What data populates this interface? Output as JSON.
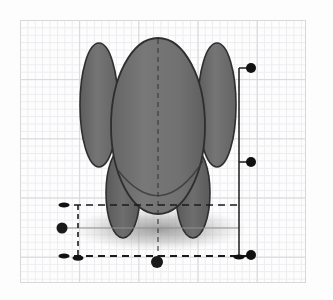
{
  "app": {
    "kind": "3d-modeling-viewport",
    "view_label": "front",
    "background_color": "#fdfdfd"
  },
  "canvas": {
    "x": 20,
    "y": 20,
    "width": 286,
    "height": 263,
    "border_color": "#d8d8d8",
    "grid": {
      "minor_color": "#ececf0",
      "minor_spacing": 7.4,
      "major_color": "#d6d6dc",
      "major_spacing": 59.2,
      "visible": true
    }
  },
  "model": {
    "name": "organic-blob-figure",
    "fill_color": "#6f6f6f",
    "fill_color_dark": "#5c5c5c",
    "outline_color": "#2e2e2e",
    "shadow_color": "#9a9a9a",
    "parts": [
      {
        "name": "left-arm-lobe",
        "cx": 98,
        "cy": 104,
        "rx": 19,
        "ry": 62
      },
      {
        "name": "right-arm-lobe",
        "cx": 216,
        "cy": 104,
        "rx": 19,
        "ry": 62
      },
      {
        "name": "left-leg-lobe",
        "cx": 122,
        "cy": 192,
        "rx": 17,
        "ry": 45
      },
      {
        "name": "right-leg-lobe",
        "cx": 192,
        "cy": 192,
        "rx": 17,
        "ry": 45
      },
      {
        "name": "main-body",
        "cx": 157,
        "cy": 125,
        "rx": 47,
        "ry": 88
      }
    ],
    "center_axis": {
      "name": "center-dashed-axis",
      "x": 157,
      "y1": 38,
      "y2": 262
    },
    "ground_shadow": {
      "cx": 158,
      "cy": 228,
      "rx": 88,
      "ry": 22
    }
  },
  "annotations": {
    "line_color": "#1b1b1b",
    "handle_color": "#111111",
    "guides": [
      {
        "name": "guide-right-vertical",
        "x1": 239,
        "y1": 68,
        "x2": 239,
        "y2": 256,
        "style": "solid"
      },
      {
        "name": "guide-top-right-stub",
        "x1": 239,
        "y1": 68,
        "x2": 248,
        "y2": 68,
        "style": "solid"
      },
      {
        "name": "guide-mid-right-stub",
        "x1": 239,
        "y1": 162,
        "x2": 248,
        "y2": 162,
        "style": "solid"
      },
      {
        "name": "guide-top-horizontal-dashed",
        "x1": 62,
        "y1": 205,
        "x2": 240,
        "y2": 205,
        "style": "dashed"
      },
      {
        "name": "guide-bottom-horizontal-dashed",
        "x1": 62,
        "y1": 256,
        "x2": 248,
        "y2": 256,
        "style": "dashed"
      },
      {
        "name": "guide-left-vertical-dashed",
        "x1": 78,
        "y1": 205,
        "x2": 78,
        "y2": 258,
        "style": "dashed"
      },
      {
        "name": "guide-left-mid-horizontal",
        "x1": 62,
        "y1": 228,
        "x2": 239,
        "y2": 228,
        "style": "thin"
      }
    ],
    "handles": [
      {
        "name": "handle-top-right",
        "x": 251,
        "y": 68,
        "r": 5,
        "shape": "circle"
      },
      {
        "name": "handle-mid-right",
        "x": 251,
        "y": 162,
        "r": 5,
        "shape": "circle"
      },
      {
        "name": "handle-bottom-right",
        "x": 251,
        "y": 255,
        "r": 5,
        "shape": "circle"
      },
      {
        "name": "handle-left-mid",
        "x": 62,
        "y": 228,
        "r": 5,
        "shape": "circle"
      },
      {
        "name": "handle-bottom-center",
        "x": 157,
        "y": 262,
        "r": 6,
        "shape": "circle"
      },
      {
        "name": "handle-top-left-tick",
        "x": 64,
        "y": 205,
        "rx": 5,
        "ry": 2.5,
        "shape": "ellipse"
      },
      {
        "name": "handle-bottom-left-tick",
        "x": 64,
        "y": 256,
        "rx": 5,
        "ry": 2.5,
        "shape": "ellipse"
      },
      {
        "name": "handle-bottom-stem-tick",
        "x": 78,
        "y": 258,
        "rx": 5,
        "ry": 2.5,
        "shape": "ellipse"
      },
      {
        "name": "handle-bottom-right-tick",
        "x": 239,
        "y": 257,
        "rx": 5,
        "ry": 2.5,
        "shape": "ellipse"
      }
    ]
  }
}
